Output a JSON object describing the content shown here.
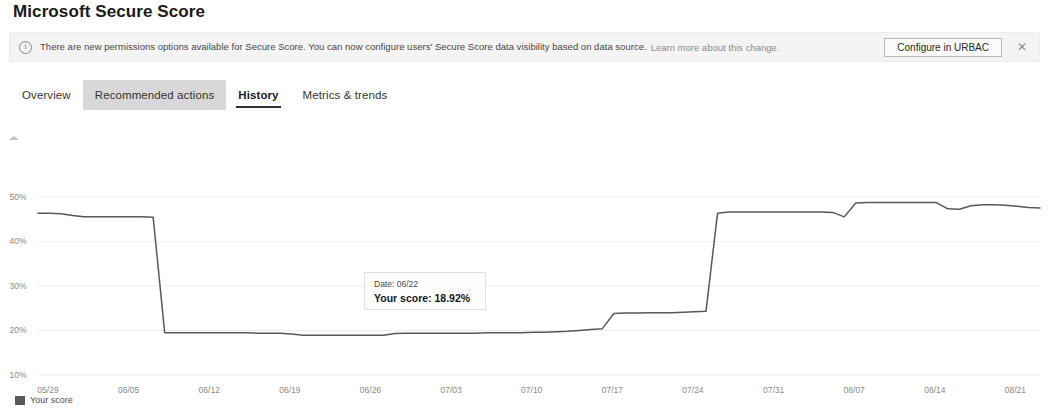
{
  "page_title": "Microsoft Secure Score",
  "message_bar": {
    "icon": "info-icon",
    "text": "There are new permissions options available for Secure Score. You can now configure users' Secure Score data visibility based on data source.",
    "link_text": "Learn more about this change.",
    "action_label": "Configure in URBAC",
    "dismiss_glyph": "✕"
  },
  "tabs": [
    {
      "label": "Overview",
      "state": "normal"
    },
    {
      "label": "Recommended actions",
      "state": "hovered"
    },
    {
      "label": "History",
      "state": "selected"
    },
    {
      "label": "Metrics & trends",
      "state": "normal"
    }
  ],
  "tooltip": {
    "date": "Date: 06/22",
    "score": "Your score: 18.92%"
  },
  "legend": {
    "label": "Your score",
    "color": "#5a5856"
  },
  "chart_data": {
    "type": "line",
    "title": "",
    "xlabel": "",
    "ylabel": "",
    "ylim": [
      10,
      54
    ],
    "yticks": [
      50,
      40,
      30,
      20,
      10
    ],
    "ytick_labels": [
      "50%",
      "40%",
      "30%",
      "20%",
      "10%"
    ],
    "grid": true,
    "legend_position": "bottom-left",
    "line_color": "#5a5856",
    "xticks": [
      "05/29",
      "06/05",
      "06/12",
      "06/19",
      "06/26",
      "07/03",
      "07/10",
      "07/17",
      "07/24",
      "07/31",
      "08/07",
      "08/14",
      "08/21"
    ],
    "series": [
      {
        "name": "Your score",
        "x": [
          "05/29",
          "05/30",
          "05/31",
          "06/01",
          "06/02",
          "06/03",
          "06/04",
          "06/05",
          "06/06",
          "06/07",
          "06/08",
          "06/09",
          "06/10",
          "06/11",
          "06/12",
          "06/13",
          "06/14",
          "06/15",
          "06/16",
          "06/17",
          "06/18",
          "06/19",
          "06/20",
          "06/21",
          "06/22",
          "06/23",
          "06/24",
          "06/25",
          "06/26",
          "06/27",
          "06/28",
          "06/29",
          "06/30",
          "07/01",
          "07/02",
          "07/03",
          "07/04",
          "07/05",
          "07/06",
          "07/07",
          "07/08",
          "07/09",
          "07/10",
          "07/11",
          "07/12",
          "07/13",
          "07/14",
          "07/15",
          "07/16",
          "07/17",
          "07/18",
          "07/19",
          "07/20",
          "07/21",
          "07/22",
          "07/23",
          "07/24",
          "07/25",
          "07/26",
          "07/27",
          "07/28",
          "07/29",
          "07/30",
          "07/31",
          "08/01",
          "08/02",
          "08/03",
          "08/04",
          "08/05",
          "08/06",
          "08/07",
          "08/08",
          "08/09",
          "08/10",
          "08/11",
          "08/12",
          "08/13",
          "08/14",
          "08/15",
          "08/16",
          "08/17",
          "08/18",
          "08/19",
          "08/20",
          "08/21",
          "08/22",
          "08/23",
          "08/24"
        ],
        "values": [
          46.3,
          46.3,
          46.2,
          45.8,
          45.5,
          45.5,
          45.5,
          45.5,
          45.5,
          45.5,
          45.4,
          19.5,
          19.5,
          19.5,
          19.5,
          19.5,
          19.5,
          19.5,
          19.5,
          19.4,
          19.4,
          19.4,
          19.2,
          18.95,
          18.92,
          18.9,
          18.9,
          18.9,
          18.9,
          18.9,
          18.9,
          19.3,
          19.4,
          19.4,
          19.4,
          19.4,
          19.4,
          19.4,
          19.4,
          19.5,
          19.5,
          19.5,
          19.5,
          19.6,
          19.6,
          19.7,
          19.8,
          20.0,
          20.2,
          20.4,
          23.8,
          23.9,
          23.9,
          24.0,
          24.0,
          24.0,
          24.1,
          24.2,
          24.3,
          46.3,
          46.6,
          46.6,
          46.6,
          46.6,
          46.6,
          46.6,
          46.6,
          46.6,
          46.6,
          46.5,
          45.5,
          48.6,
          48.7,
          48.7,
          48.7,
          48.7,
          48.7,
          48.7,
          48.7,
          47.3,
          47.2,
          48.0,
          48.2,
          48.2,
          48.1,
          47.9,
          47.6,
          47.5
        ]
      }
    ]
  }
}
